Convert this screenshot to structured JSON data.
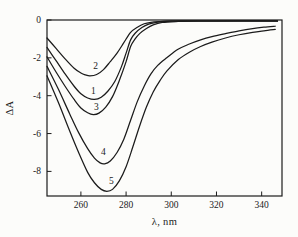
{
  "figure": {
    "background": "#fcfcfa",
    "ink_color": "#1b1b1b",
    "kind": "difference-absorption-spectra"
  },
  "chart_data": {
    "type": "line",
    "title": "",
    "xlabel": "λ, nm",
    "ylabel": "ΔA",
    "xlim": [
      245,
      349
    ],
    "ylim": [
      -9.3,
      0
    ],
    "x_ticks": [
      260,
      280,
      300,
      320,
      340
    ],
    "y_ticks": [
      0,
      -2,
      -4,
      -6,
      -8
    ],
    "grid": false,
    "frame": true,
    "legend_position": "inline-curve-numbers",
    "series": [
      {
        "name": "1",
        "label": "1",
        "label_at": [
          265.5,
          -3.72
        ],
        "minimum": [
          266,
          -4.2
        ],
        "points": [
          [
            245,
            -1.45
          ],
          [
            249,
            -2.15
          ],
          [
            253,
            -2.85
          ],
          [
            257,
            -3.5
          ],
          [
            260,
            -3.9
          ],
          [
            263,
            -4.12
          ],
          [
            266,
            -4.2
          ],
          [
            269,
            -4.08
          ],
          [
            272,
            -3.75
          ],
          [
            275,
            -3.25
          ],
          [
            278,
            -2.45
          ],
          [
            280,
            -1.75
          ],
          [
            282,
            -1.05
          ],
          [
            284,
            -0.7
          ],
          [
            287,
            -0.4
          ],
          [
            290,
            -0.22
          ],
          [
            294,
            -0.11
          ],
          [
            298,
            -0.07
          ],
          [
            305,
            -0.05
          ],
          [
            320,
            -0.05
          ],
          [
            347,
            -0.05
          ]
        ]
      },
      {
        "name": "2",
        "label": "2",
        "label_at": [
          266.5,
          -2.42
        ],
        "minimum": [
          264,
          -2.95
        ],
        "points": [
          [
            245,
            -0.95
          ],
          [
            249,
            -1.5
          ],
          [
            253,
            -2.05
          ],
          [
            257,
            -2.55
          ],
          [
            260,
            -2.8
          ],
          [
            262,
            -2.9
          ],
          [
            264,
            -2.95
          ],
          [
            267,
            -2.88
          ],
          [
            270,
            -2.62
          ],
          [
            273,
            -2.2
          ],
          [
            276,
            -1.75
          ],
          [
            279,
            -1.2
          ],
          [
            282,
            -0.65
          ],
          [
            285,
            -0.38
          ],
          [
            288,
            -0.2
          ],
          [
            291,
            -0.12
          ],
          [
            295,
            -0.08
          ],
          [
            300,
            -0.05
          ],
          [
            320,
            -0.04
          ],
          [
            347,
            -0.04
          ]
        ]
      },
      {
        "name": "3",
        "label": "3",
        "label_at": [
          266.8,
          -4.58
        ],
        "minimum": [
          265.5,
          -5.0
        ],
        "points": [
          [
            245,
            -1.95
          ],
          [
            249,
            -2.75
          ],
          [
            253,
            -3.5
          ],
          [
            257,
            -4.2
          ],
          [
            260,
            -4.65
          ],
          [
            263,
            -4.9
          ],
          [
            265.5,
            -5.0
          ],
          [
            268,
            -4.92
          ],
          [
            271,
            -4.6
          ],
          [
            274,
            -4.05
          ],
          [
            277,
            -3.2
          ],
          [
            280,
            -2.2
          ],
          [
            282,
            -1.4
          ],
          [
            284,
            -1.0
          ],
          [
            286,
            -0.72
          ],
          [
            289,
            -0.45
          ],
          [
            292,
            -0.26
          ],
          [
            296,
            -0.13
          ],
          [
            302,
            -0.08
          ],
          [
            312,
            -0.06
          ],
          [
            347,
            -0.06
          ]
        ]
      },
      {
        "name": "4",
        "label": "4",
        "label_at": [
          270.0,
          -6.98
        ],
        "minimum": [
          270.5,
          -7.6
        ],
        "points": [
          [
            245,
            -2.45
          ],
          [
            250,
            -3.65
          ],
          [
            255,
            -4.95
          ],
          [
            259,
            -5.95
          ],
          [
            263,
            -6.8
          ],
          [
            266,
            -7.3
          ],
          [
            268.5,
            -7.55
          ],
          [
            270.5,
            -7.6
          ],
          [
            273,
            -7.45
          ],
          [
            276,
            -7.0
          ],
          [
            279,
            -6.3
          ],
          [
            282,
            -5.3
          ],
          [
            285,
            -4.3
          ],
          [
            288,
            -3.5
          ],
          [
            291,
            -2.85
          ],
          [
            294,
            -2.4
          ],
          [
            298,
            -2.0
          ],
          [
            303,
            -1.55
          ],
          [
            308,
            -1.27
          ],
          [
            313,
            -1.05
          ],
          [
            318,
            -0.88
          ],
          [
            324,
            -0.72
          ],
          [
            330,
            -0.57
          ],
          [
            336,
            -0.45
          ],
          [
            341,
            -0.38
          ],
          [
            346,
            -0.33
          ]
        ]
      },
      {
        "name": "5",
        "label": "5",
        "label_at": [
          273.5,
          -8.52
        ],
        "minimum": [
          271.5,
          -9.05
        ],
        "points": [
          [
            245,
            -2.95
          ],
          [
            250,
            -4.35
          ],
          [
            255,
            -5.85
          ],
          [
            259,
            -7.0
          ],
          [
            263,
            -8.05
          ],
          [
            266,
            -8.6
          ],
          [
            269,
            -8.95
          ],
          [
            271.5,
            -9.05
          ],
          [
            274,
            -8.95
          ],
          [
            277,
            -8.5
          ],
          [
            280,
            -7.75
          ],
          [
            283,
            -6.7
          ],
          [
            286,
            -5.6
          ],
          [
            289,
            -4.6
          ],
          [
            292,
            -3.8
          ],
          [
            295,
            -3.2
          ],
          [
            298,
            -2.7
          ],
          [
            303,
            -2.1
          ],
          [
            308,
            -1.7
          ],
          [
            313,
            -1.4
          ],
          [
            318,
            -1.17
          ],
          [
            324,
            -0.95
          ],
          [
            330,
            -0.78
          ],
          [
            336,
            -0.65
          ],
          [
            341,
            -0.57
          ],
          [
            346,
            -0.5
          ]
        ]
      }
    ]
  }
}
